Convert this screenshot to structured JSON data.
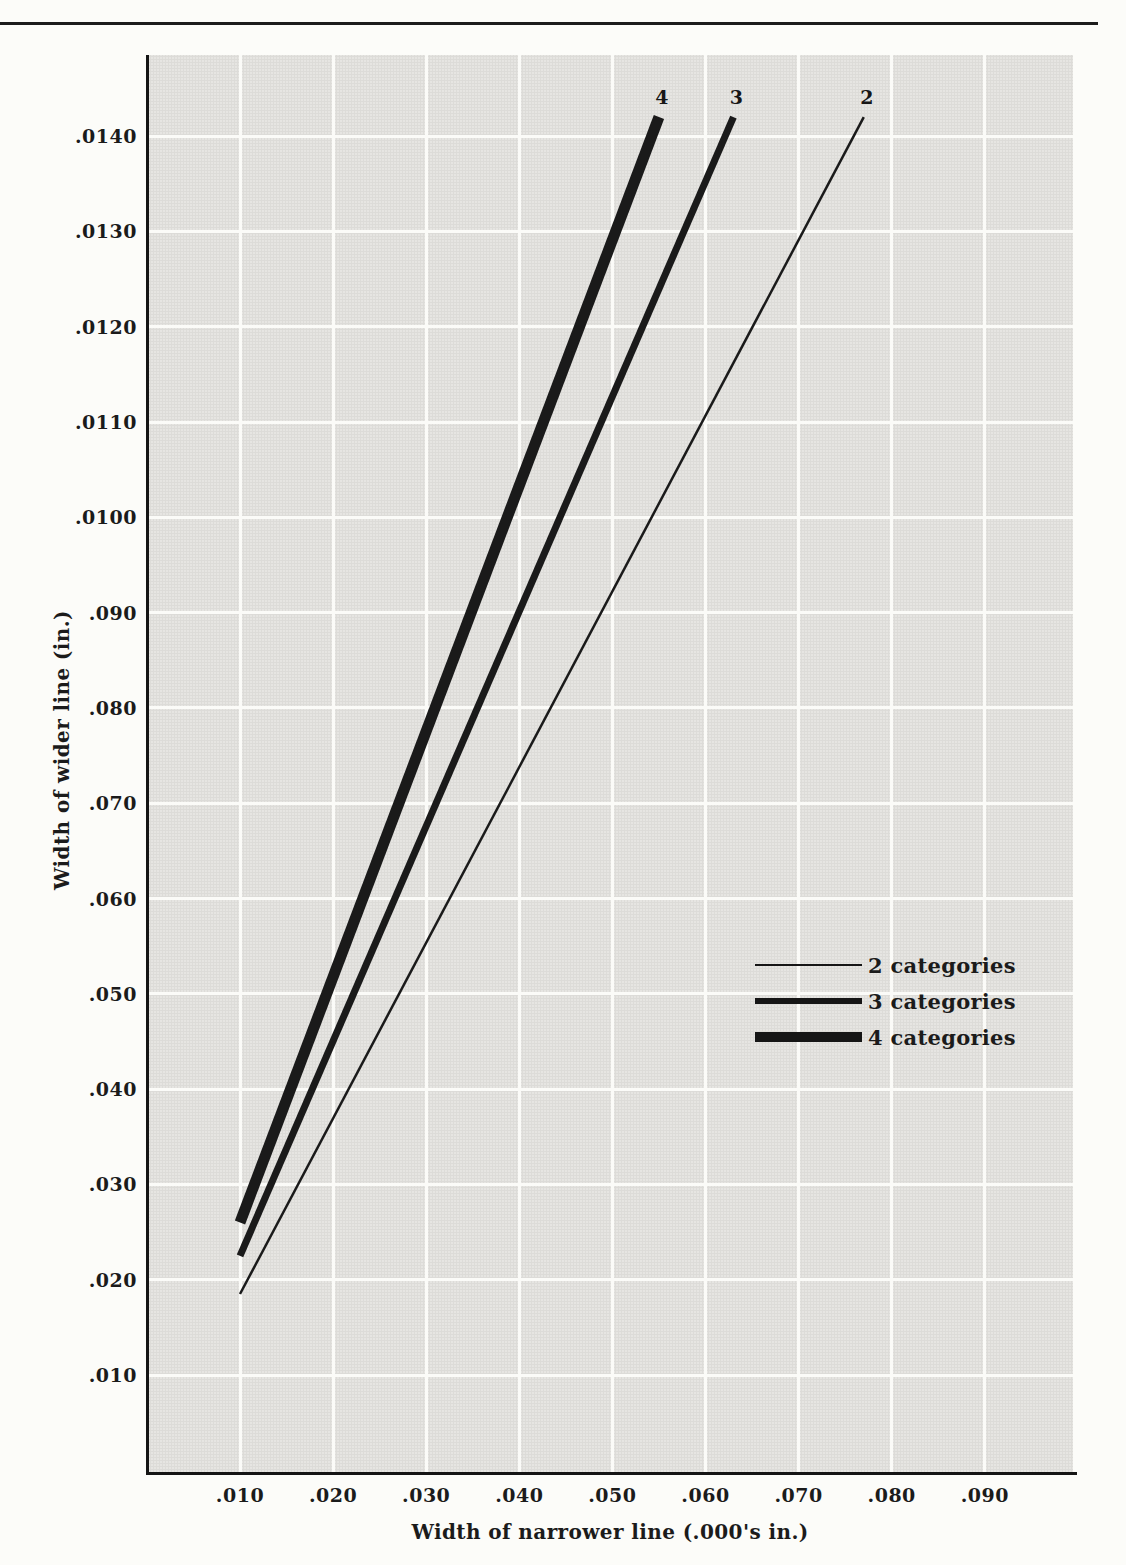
{
  "colors": {
    "ink": "#1a1a1a",
    "plot_background": "#e6e5e2",
    "gridline": "#fbfbf8",
    "page_background": "#fcfcf9"
  },
  "chart_data": {
    "type": "line",
    "title": "",
    "xlabel": "Width of narrower line (.000's in.)",
    "ylabel": "Width of wider line (in.)",
    "grid": true,
    "legend_position": "lower right",
    "x_axis": {
      "units_note": "tick values in thousandths of an inch",
      "ticks": [
        {
          "label": ".010",
          "value": 10
        },
        {
          "label": ".020",
          "value": 20
        },
        {
          "label": ".030",
          "value": 30
        },
        {
          "label": ".040",
          "value": 40
        },
        {
          "label": ".050",
          "value": 50
        },
        {
          "label": ".060",
          "value": 60
        },
        {
          "label": ".070",
          "value": 70
        },
        {
          "label": ".080",
          "value": 80
        },
        {
          "label": ".090",
          "value": 90
        }
      ]
    },
    "y_axis": {
      "units_note": "tick values in thousandths of an inch",
      "ticks": [
        {
          "label": ".010",
          "value": 10
        },
        {
          "label": ".020",
          "value": 20
        },
        {
          "label": ".030",
          "value": 30
        },
        {
          "label": ".040",
          "value": 40
        },
        {
          "label": ".050",
          "value": 50
        },
        {
          "label": ".060",
          "value": 60
        },
        {
          "label": ".070",
          "value": 70
        },
        {
          "label": ".080",
          "value": 80
        },
        {
          "label": ".090",
          "value": 90
        },
        {
          "label": ".0100",
          "value": 100
        },
        {
          "label": ".0110",
          "value": 110
        },
        {
          "label": ".0120",
          "value": 120
        },
        {
          "label": ".0130",
          "value": 130
        },
        {
          "label": ".0140",
          "value": 140
        }
      ]
    },
    "series": [
      {
        "name": "2 categories",
        "end_label": "2",
        "thickness": "thin",
        "stroke_px": 2.5,
        "approx_wider_to_narrower_ratio": 1.85,
        "points": [
          [
            10,
            18.5
          ],
          [
            77,
            142
          ]
        ]
      },
      {
        "name": "3 categories",
        "end_label": "3",
        "thickness": "medium",
        "stroke_px": 7,
        "approx_wider_to_narrower_ratio": 2.25,
        "points": [
          [
            10,
            22.5
          ],
          [
            63,
            142
          ]
        ]
      },
      {
        "name": "4 categories",
        "end_label": "4",
        "thickness": "thick",
        "stroke_px": 11,
        "approx_wider_to_narrower_ratio": 2.6,
        "points": [
          [
            10,
            26
          ],
          [
            55,
            142
          ]
        ]
      }
    ],
    "legend": {
      "entries": [
        {
          "label": "2 categories"
        },
        {
          "label": "3 categories"
        },
        {
          "label": "4 categories"
        }
      ]
    }
  }
}
